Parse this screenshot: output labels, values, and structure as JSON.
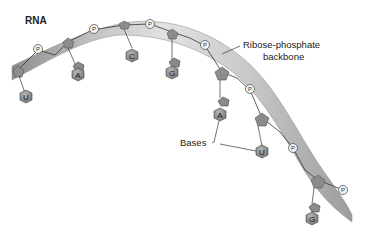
{
  "diagram": {
    "title": "RNA",
    "labels": {
      "backbone_line1": "Ribose-phosphate",
      "backbone_line2": "backbone",
      "bases": "Bases"
    },
    "phosphate_label": "P",
    "bases": [
      {
        "letter": "U"
      },
      {
        "letter": "A"
      },
      {
        "letter": "C"
      },
      {
        "letter": "G"
      },
      {
        "letter": "A"
      },
      {
        "letter": "U"
      },
      {
        "letter": "G"
      }
    ],
    "colors": {
      "ribbon_dark": "#9a9a9a",
      "ribbon_light": "#dcdcdc",
      "sugar": "#8c8c8c",
      "base": "#8a8a8a",
      "base_label_bg": "#7d7d7d",
      "line": "#333333"
    }
  }
}
